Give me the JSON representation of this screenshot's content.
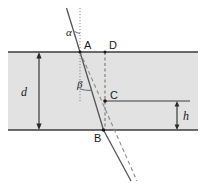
{
  "figure": {
    "type": "optics-refraction-slab-diagram",
    "background_color": "#ffffff",
    "slab_fill_color": "#e2e2e2",
    "line_color": "#3c3c3c",
    "label_color": "#1a1a1a"
  },
  "labels": {
    "alpha": "α",
    "beta": "β",
    "point_a": "A",
    "point_b": "B",
    "point_c": "C",
    "point_d": "D",
    "thickness_d": "d",
    "offset_h": "h"
  },
  "geometry": {
    "slab": {
      "x": 8,
      "y": 52,
      "width": 190,
      "height": 78
    },
    "point_a": {
      "x": 80,
      "y": 52
    },
    "point_b": {
      "x": 103.5,
      "y": 130
    },
    "point_c": {
      "x": 105,
      "y": 101
    },
    "point_d": {
      "x": 105,
      "y": 52
    },
    "incident_ray": {
      "x1": 66.5,
      "y1": 8,
      "x2": 80,
      "y2": 52
    },
    "refracted_ray": {
      "x1": 80,
      "y1": 52,
      "x2": 103.5,
      "y2": 130
    },
    "exit_ray": {
      "x1": 103.5,
      "y1": 130,
      "x2": 131,
      "y2": 180
    },
    "undeviated_dashed_ray": {
      "x1": 80,
      "y1": 52,
      "x2": 137,
      "y2": 180
    },
    "normal_top": {
      "x": 80,
      "y1": 8,
      "y2": 52
    },
    "normal_inside": {
      "x": 80,
      "y1": 52,
      "y2": 101
    },
    "vertical_dashed_d_to_b": {
      "x": 105,
      "y1": 52,
      "y2": 130
    },
    "h_level_line": {
      "x1": 105,
      "y1": 101,
      "x2": 190,
      "y2": 101
    },
    "d_dimension": {
      "x": 39,
      "y1": 52,
      "y2": 130
    },
    "h_dimension": {
      "x": 177,
      "y1": 101,
      "y2": 130
    }
  },
  "annotations": {
    "alpha_description": "angle of incidence between incident ray and surface normal at A",
    "beta_description": "angle of refraction between normal and refracted ray inside slab",
    "d_description": "slab thickness",
    "h_description": "lateral vertical offset of emergent ray"
  }
}
